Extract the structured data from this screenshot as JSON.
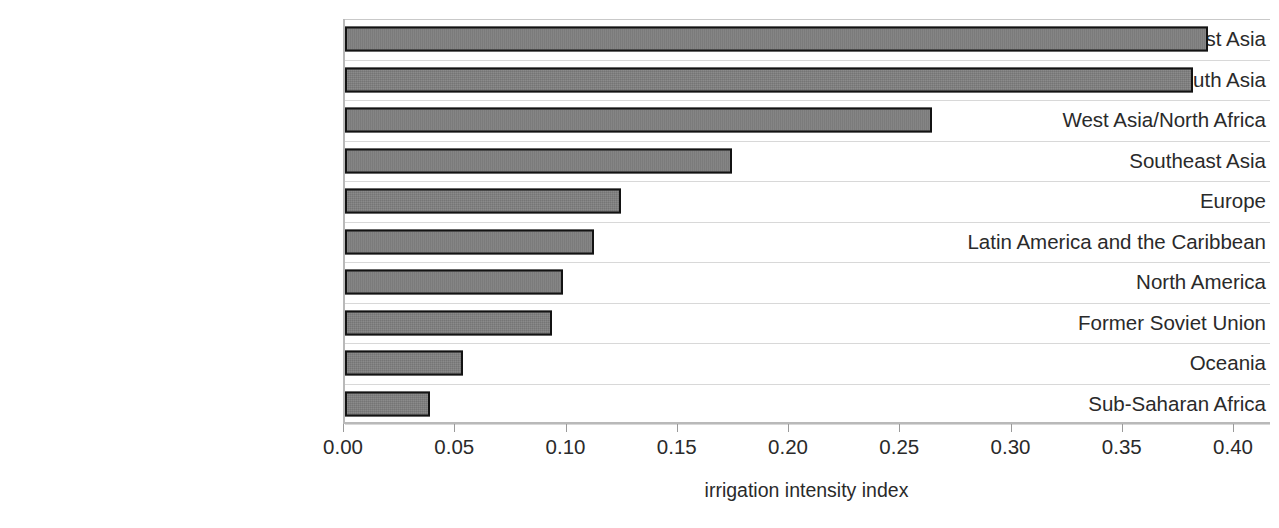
{
  "chart_data": {
    "type": "bar",
    "orientation": "horizontal",
    "title": "",
    "xlabel": "irrigation intensity index",
    "ylabel": "",
    "xlim": [
      0.0,
      0.4
    ],
    "xticks": [
      "0.00",
      "0.05",
      "0.10",
      "0.15",
      "0.20",
      "0.25",
      "0.30",
      "0.35",
      "0.40"
    ],
    "xtick_values": [
      0.0,
      0.05,
      0.1,
      0.15,
      0.2,
      0.25,
      0.3,
      0.35,
      0.4
    ],
    "grid": true,
    "legend": false,
    "bar_fill_color": "#7d7d7d",
    "bar_border_color": "#131313",
    "categories": [
      "East Asia",
      "South Asia",
      "West Asia/North Africa",
      "Southeast Asia",
      "Europe",
      "Latin America and the Caribbean",
      "North America",
      "Former Soviet Union",
      "Oceania",
      "Sub-Saharan Africa"
    ],
    "values": [
      0.388,
      0.381,
      0.264,
      0.174,
      0.124,
      0.112,
      0.098,
      0.093,
      0.053,
      0.038
    ]
  }
}
